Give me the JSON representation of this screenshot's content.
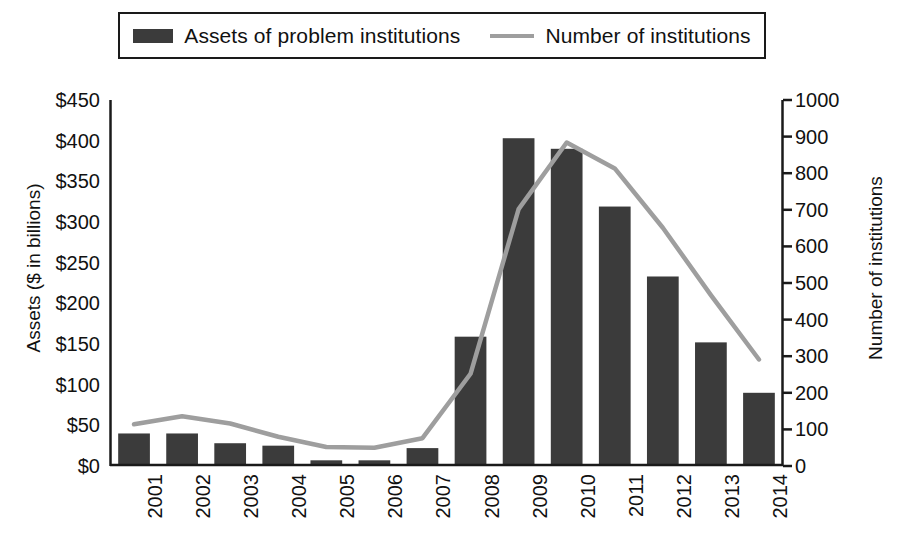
{
  "legend": {
    "position": "top",
    "entries": [
      {
        "label": "Assets of problem institutions",
        "marker": "bar-swatch-icon",
        "color": "#3b3b3b"
      },
      {
        "label": "Number of institutions",
        "marker": "line-swatch-icon",
        "color": "#9e9e9e"
      }
    ]
  },
  "axes": {
    "y_left": {
      "title": "Assets ($ in billions)",
      "ticks": [
        "$0",
        "$50",
        "$100",
        "$150",
        "$200",
        "$250",
        "$300",
        "$350",
        "$400",
        "$450"
      ]
    },
    "y_right": {
      "title": "Number of institutions",
      "ticks": [
        "0",
        "100",
        "200",
        "300",
        "400",
        "500",
        "600",
        "700",
        "800",
        "900",
        "1000"
      ]
    },
    "x": {
      "title": "",
      "ticks": [
        "2001",
        "2002",
        "2003",
        "2004",
        "2005",
        "2006",
        "2007",
        "2008",
        "2009",
        "2010",
        "2011",
        "2012",
        "2013",
        "2014"
      ]
    }
  },
  "chart_data": {
    "type": "bar",
    "title": "",
    "subtitle": "",
    "xlabel": "",
    "ylabel": "Assets ($ in billions)",
    "y2label": "Number of institutions",
    "categories": [
      "2001",
      "2002",
      "2003",
      "2004",
      "2005",
      "2006",
      "2007",
      "2008",
      "2009",
      "2010",
      "2011",
      "2012",
      "2013",
      "2014"
    ],
    "series": [
      {
        "name": "Assets of problem institutions",
        "type": "bar",
        "axis": "left",
        "unit": "$ billions",
        "color": "#3b3b3b",
        "values": [
          40,
          40,
          28,
          25,
          7,
          7,
          22,
          159,
          403,
          390,
          319,
          233,
          152,
          90
        ]
      },
      {
        "name": "Number of institutions",
        "type": "line",
        "axis": "right",
        "unit": "institutions",
        "color": "#9e9e9e",
        "values": [
          114,
          136,
          116,
          80,
          52,
          50,
          76,
          252,
          702,
          884,
          813,
          651,
          467,
          291
        ]
      }
    ],
    "ylim": [
      0,
      450
    ],
    "y2lim": [
      0,
      1000
    ],
    "ytick_step": 50,
    "y2tick_step": 100,
    "grid": false,
    "legend_position": "top"
  },
  "style": {
    "background": "#ffffff",
    "axis_color": "#1a1a1a",
    "bar_color": "#3b3b3b",
    "line_color": "#9e9e9e",
    "text_color": "#111111"
  }
}
